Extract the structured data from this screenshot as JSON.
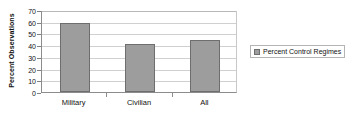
{
  "chart_data": {
    "type": "bar",
    "title": "",
    "subtitle": "",
    "xlabel": "",
    "ylabel": "Percent Observations",
    "categories": [
      "Military",
      "Civilian",
      "All"
    ],
    "values": [
      59,
      41,
      44
    ],
    "series": [
      {
        "name": "Percent Control Regimes",
        "values": [
          59,
          41,
          44
        ],
        "color": "#9d9d9d"
      }
    ],
    "ylim": [
      0,
      70
    ],
    "ytick_interval": 10,
    "ytick_labels": [
      "0",
      "10",
      "20",
      "30",
      "40",
      "50",
      "60",
      "70"
    ],
    "ytick_values": [
      0,
      10,
      20,
      30,
      40,
      50,
      60,
      70
    ],
    "grid": true,
    "grid_axis": "y",
    "legend": {
      "position": "right",
      "entries": [
        {
          "label": "Percent Control Regimes",
          "color": "#9d9d9d"
        }
      ]
    },
    "colors": {
      "bar_fill": "#9d9d9d",
      "bar_border": "#6e6e6e",
      "gridline": "#d0d0d0",
      "axis": "#8c8c8c",
      "text": "#111111",
      "background": "#ffffff"
    }
  }
}
